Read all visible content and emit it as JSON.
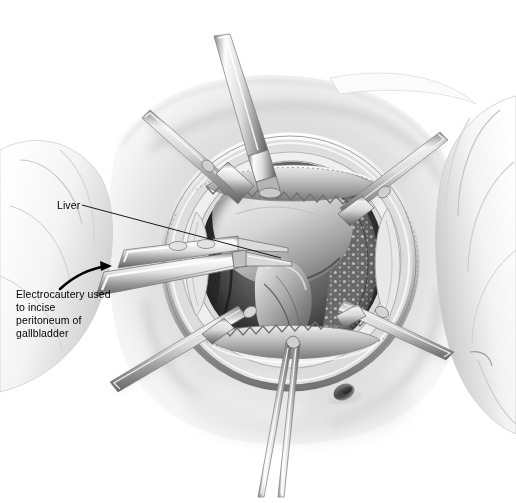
{
  "figure": {
    "kind": "medical-illustration",
    "technique": "grayscale pen-and-ink with airbrush shading",
    "background_color": "#ffffff",
    "ink_color": "#000000",
    "canvas": {
      "width": 516,
      "height": 503
    }
  },
  "palette": {
    "paper": "#ffffff",
    "drape_light": "#f2f2f2",
    "drape_shadow": "#c9c9c9",
    "skin_light": "#ededed",
    "skin_mid": "#cfcfcf",
    "skin_shadow": "#9a9a9a",
    "tissue_mid": "#9e9e9e",
    "tissue_dark": "#5a5a5a",
    "cavity_dark": "#3a3a3a",
    "cavity_deep": "#222222",
    "steel_light": "#fafafa",
    "steel_mid": "#b8b8b8",
    "steel_dark": "#6e6e6e",
    "outline": "#2a2a2a"
  },
  "annotations": [
    {
      "id": "liver",
      "text": "Liver",
      "x": 57,
      "y": 199,
      "leader": {
        "from": [
          82,
          205
        ],
        "to": [
          281,
          258
        ],
        "style": "straight-line"
      }
    },
    {
      "id": "electrocautery",
      "text": "Electrocautery used\nto incise\nperitoneum of\ngallbladder",
      "lines": [
        "Electrocautery used",
        "to incise",
        "peritoneum of",
        "gallbladder"
      ],
      "x": 16,
      "y": 288,
      "leader": {
        "from": [
          60,
          288
        ],
        "to": [
          112,
          266
        ],
        "style": "curved-arrow"
      }
    }
  ],
  "anatomy": [
    {
      "name": "liver",
      "note": "pale lobe filling upper centre of the wound"
    },
    {
      "name": "gallbladder",
      "note": "pear-shaped body below the liver edge, being dissected"
    },
    {
      "name": "omentum",
      "note": "fat-studded tissue at right of the cavity"
    },
    {
      "name": "abdominal-wall",
      "note": "skin and fascia surrounding the wound"
    },
    {
      "name": "umbilicus",
      "note": "small dark navel depression below the wound"
    }
  ],
  "instruments": [
    {
      "name": "ring-retractor",
      "note": "oval self-retaining frame encircling the wound"
    },
    {
      "name": "toothed-retractor-blade-upper",
      "note": "saw-tooth edged blade, superior"
    },
    {
      "name": "toothed-retractor-blade-lower",
      "note": "saw-tooth edged blade, inferior"
    },
    {
      "name": "retractor-arm-top",
      "note": "tapering handle descending from top of frame"
    },
    {
      "name": "retractor-arm-upper-left",
      "note": "rod angled toward upper left"
    },
    {
      "name": "retractor-arm-upper-right",
      "note": "rod angled toward upper right"
    },
    {
      "name": "retractor-arm-lower-left",
      "note": "rod angled toward lower left"
    },
    {
      "name": "retractor-arm-lower-right",
      "note": "rod angled toward lower right"
    },
    {
      "name": "electrocautery-probe",
      "note": "tapered pencil entering from left, tip at gallbladder"
    },
    {
      "name": "grasping-forceps",
      "note": "slender forceps rising from bottom of the field"
    },
    {
      "name": "surgical-drapes",
      "note": "folded cloth framing the field left and right"
    }
  ]
}
